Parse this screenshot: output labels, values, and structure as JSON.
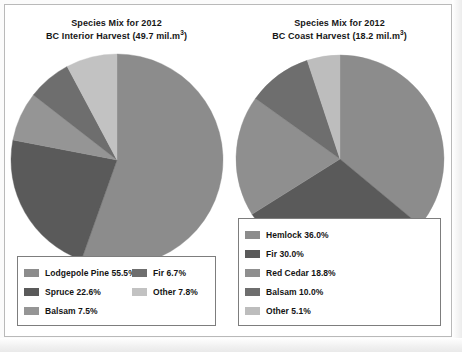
{
  "figure": {
    "panels": [
      {
        "id": "bc-interior",
        "title_line1": "Species Mix for 2012",
        "title_line2_pre": "BC Interior Harvest (49.7 mil.m",
        "title_line2_sup": "3",
        "title_line2_post": ")"
      },
      {
        "id": "bc-coast",
        "title_line1": "Species Mix for 2012",
        "title_line2_pre": "BC Coast Harvest (18.2 mil.m",
        "title_line2_sup": "3",
        "title_line2_post": ")"
      }
    ]
  },
  "legends": {
    "interior": {
      "column_a": [
        {
          "label": "Lodgepole Pine 55.5%",
          "color": "#8c8c8c"
        },
        {
          "label": "Spruce 22.6%",
          "color": "#5a5a5a"
        },
        {
          "label": "Balsam 7.5%",
          "color": "#959595"
        }
      ],
      "column_b": [
        {
          "label": "Fir 6.7%",
          "color": "#6e6e6e"
        },
        {
          "label": "Other 7.8%",
          "color": "#c2c2c2"
        }
      ]
    },
    "coast": {
      "column_a": [
        {
          "label": "Hemlock 36.0%",
          "color": "#8c8c8c"
        },
        {
          "label": "Fir 30.0%",
          "color": "#5a5a5a"
        },
        {
          "label": "Red Cedar 18.8%",
          "color": "#8f8f8f"
        }
      ],
      "column_b": [
        {
          "label": "Balsam 10.0%",
          "color": "#6e6e6e"
        },
        {
          "label": "Other 5.1%",
          "color": "#bdbdbd"
        }
      ]
    }
  },
  "chart_data": [
    {
      "type": "pie",
      "id": "bc-interior-pie",
      "title": "Species Mix for 2012 BC Interior Harvest (49.7 mil.m3)",
      "total_label": "49.7 mil.m3",
      "start_angle_deg": 0,
      "direction": "clockwise",
      "legend_position": "bottom",
      "categories": [
        "Lodgepole Pine",
        "Spruce",
        "Balsam",
        "Fir",
        "Other"
      ],
      "values": [
        55.5,
        22.6,
        7.5,
        6.7,
        7.8
      ],
      "unit": "%",
      "colors": [
        "#8c8c8c",
        "#5a5a5a",
        "#959595",
        "#6e6e6e",
        "#c2c2c2"
      ]
    },
    {
      "type": "pie",
      "id": "bc-coast-pie",
      "title": "Species Mix for 2012 BC Coast Harvest (18.2 mil.m3)",
      "total_label": "18.2 mil.m3",
      "start_angle_deg": 0,
      "direction": "clockwise",
      "legend_position": "bottom",
      "categories": [
        "Hemlock",
        "Fir",
        "Red Cedar",
        "Balsam",
        "Other"
      ],
      "values": [
        36.0,
        30.0,
        18.8,
        10.0,
        5.1
      ],
      "unit": "%",
      "colors": [
        "#8c8c8c",
        "#5a5a5a",
        "#8f8f8f",
        "#6e6e6e",
        "#bdbdbd"
      ]
    }
  ]
}
